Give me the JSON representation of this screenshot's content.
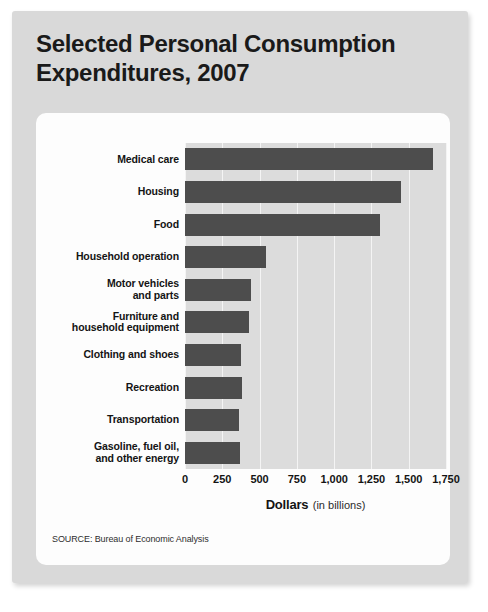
{
  "title": "Selected Personal Consumption Expenditures, 2007",
  "title_line1": "Selected Personal Consumption",
  "title_line2": "Expenditures, 2007",
  "axis_title_main": "Dollars",
  "axis_title_sub": "(in billions)",
  "source": "SOURCE: Bureau of Economic Analysis",
  "colors": {
    "bar": "#4d4d4d",
    "plot_background": "#dcdcdc",
    "gridline": "#f4f4f4",
    "card_background": "#d9d9d9",
    "panel_background": "#fdfdfd",
    "text": "#141414"
  },
  "chart_data": {
    "type": "bar",
    "orientation": "horizontal",
    "title": "Selected Personal Consumption Expenditures, 2007",
    "xlabel": "Dollars (in billions)",
    "ylabel": "",
    "xlim": [
      0,
      1750
    ],
    "grid": true,
    "legend": false,
    "xticks": [
      0,
      250,
      500,
      750,
      1000,
      1250,
      1500,
      1750
    ],
    "xticklabels": [
      "0",
      "250",
      "500",
      "750",
      "1,000",
      "1,250",
      "1,500",
      "1,750"
    ],
    "categories": [
      "Medical care",
      "Housing",
      "Food",
      "Household operation",
      "Motor vehicles and parts",
      "Furniture and household equipment",
      "Clothing and shoes",
      "Recreation",
      "Transportation",
      "Gasoline, fuel oil, and other energy"
    ],
    "category_lines": [
      [
        "Medical care"
      ],
      [
        "Housing"
      ],
      [
        "Food"
      ],
      [
        "Household operation"
      ],
      [
        "Motor vehicles",
        "and parts"
      ],
      [
        "Furniture and",
        "household equipment"
      ],
      [
        "Clothing and shoes"
      ],
      [
        "Recreation"
      ],
      [
        "Transportation"
      ],
      [
        "Gasoline, fuel oil,",
        "and other energy"
      ]
    ],
    "values": [
      1660,
      1450,
      1310,
      540,
      440,
      430,
      375,
      380,
      360,
      370
    ],
    "units": "billions of dollars"
  }
}
